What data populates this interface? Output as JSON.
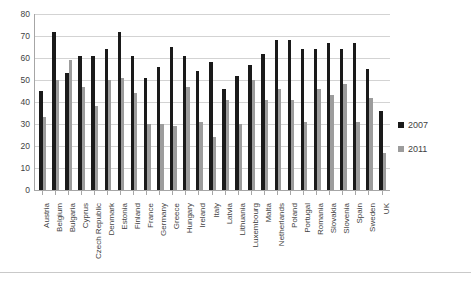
{
  "chart_data": {
    "type": "bar",
    "title": "",
    "xlabel": "",
    "ylabel": "",
    "ylim": [
      0,
      80
    ],
    "y_ticks": [
      0,
      10,
      20,
      30,
      40,
      50,
      60,
      70,
      80
    ],
    "grid": true,
    "legend_position": "right",
    "categories": [
      "Austria",
      "Belgium",
      "Bulgaria",
      "Cyprus",
      "Czech Republic",
      "Denmark",
      "Estonia",
      "Finland",
      "France",
      "Germany",
      "Greece",
      "Hungary",
      "Ireland",
      "Italy",
      "Latvia",
      "Lithuania",
      "Luxembourg",
      "Malta",
      "Netherlands",
      "Poland",
      "Portugal",
      "Romania",
      "Slovakia",
      "Slovenia",
      "Spain",
      "Sweden",
      "UK"
    ],
    "series": [
      {
        "name": "2007",
        "color": "#1a1a1a",
        "values": [
          45,
          72,
          53,
          61,
          61,
          64,
          72,
          61,
          51,
          56,
          65,
          61,
          54,
          58,
          46,
          52,
          57,
          62,
          68,
          68,
          64,
          64,
          67,
          64,
          67,
          55,
          36
        ]
      },
      {
        "name": "2011",
        "color": "#9c9c9c",
        "values": [
          33,
          50,
          59,
          47,
          38,
          50,
          51,
          44,
          30,
          30,
          29,
          47,
          31,
          24,
          41,
          30,
          50,
          41,
          46,
          41,
          31,
          46,
          43,
          48,
          31,
          42,
          17
        ]
      }
    ]
  },
  "legend": {
    "items": [
      {
        "label": "2007",
        "color": "#1a1a1a"
      },
      {
        "label": "2011",
        "color": "#9c9c9c"
      }
    ]
  },
  "title_strip": ""
}
